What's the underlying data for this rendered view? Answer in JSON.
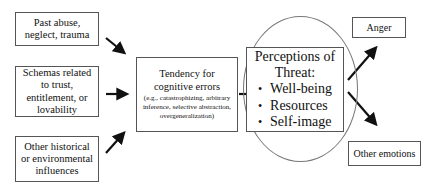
{
  "diagram": {
    "inputs": [
      {
        "label": "Past abuse, neglect, trauma"
      },
      {
        "label": "Schemas related to trust, entitlement, or lovability"
      },
      {
        "label": "Other historical or environmental influences"
      }
    ],
    "middle": {
      "title_line1": "Tendency for",
      "title_line2": "cognitive errors",
      "examples": "(e.g., catastrophizing, arbitrary inference, selective abstraction, overgeneralization)"
    },
    "threat": {
      "title_line1": "Perceptions of",
      "title_line2": "Threat:",
      "items": [
        "Well-being",
        "Resources",
        "Self-image"
      ]
    },
    "outputs": [
      {
        "label": "Anger"
      },
      {
        "label": "Other emotions"
      }
    ],
    "colors": {
      "border": "#555555",
      "arrow": "#111111",
      "circle": "#777777"
    }
  }
}
